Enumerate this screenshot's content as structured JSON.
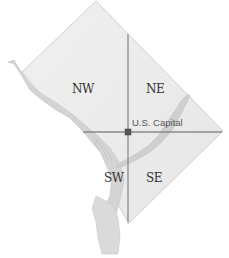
{
  "map": {
    "title": "Washington, D.C. Quadrants",
    "quadrants": [
      {
        "id": "nw",
        "label": "NW"
      },
      {
        "id": "ne",
        "label": "NE"
      },
      {
        "id": "sw",
        "label": "SW"
      },
      {
        "id": "se",
        "label": "SE"
      }
    ],
    "landmark": {
      "label": "U.S. Capital"
    },
    "colors": {
      "land": "#ececec",
      "border": "#c8c8c8",
      "river": "#d2d2d2",
      "axis": "#8a8a8a",
      "marker": "#555555"
    }
  }
}
